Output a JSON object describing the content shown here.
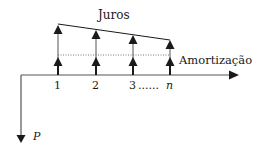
{
  "diagram": {
    "title_top": "Juros",
    "label_amortization": "Amortização",
    "x_labels": [
      "1",
      "2",
      "3",
      "......",
      "n"
    ],
    "principal_label": "P",
    "colors": {
      "stroke": "#1a1a1a",
      "axis": "#555555",
      "dotted": "#777777"
    },
    "payments": [
      {
        "period": "1",
        "x": 58,
        "top": 24
      },
      {
        "period": "2",
        "x": 96,
        "top": 30
      },
      {
        "period": "3",
        "x": 133,
        "top": 37
      },
      {
        "period": "n",
        "x": 170,
        "top": 41
      }
    ]
  }
}
